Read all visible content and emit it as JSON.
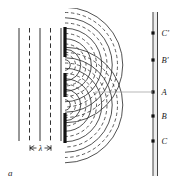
{
  "figure": {
    "panel_label": "a",
    "caption_text": ""
  },
  "plane_waves": {
    "description": "incoming plane wavefronts",
    "lines": [
      {
        "x": 19,
        "style": "solid"
      },
      {
        "x": 29.5,
        "style": "dashed"
      },
      {
        "x": 40,
        "style": "solid"
      },
      {
        "x": 50.5,
        "style": "dashed"
      },
      {
        "x": 61,
        "style": "solid"
      }
    ],
    "y_top": 28,
    "y_bottom": 141
  },
  "wavelength_marker": {
    "label": "λ",
    "x_left": 30,
    "x_right": 51,
    "y": 148
  },
  "barrier": {
    "x": 65,
    "segments": [
      {
        "y_top": 27,
        "y_bottom": 57
      },
      {
        "y_top": 73,
        "y_bottom": 97
      },
      {
        "y_top": 113,
        "y_bottom": 143
      }
    ],
    "slits": [
      {
        "x": 65,
        "y": 65
      },
      {
        "x": 65,
        "y": 105
      }
    ]
  },
  "waves": {
    "crest_style": "solid",
    "trough_style": "dashed",
    "spacing": 10.5,
    "count": 11
  },
  "screen": {
    "x_outer": 153,
    "x_inner": 157.5,
    "y_top": 12,
    "y_bottom": 176,
    "points": [
      {
        "label": "C′",
        "y": 33
      },
      {
        "label": "B′",
        "y": 60
      },
      {
        "label": "A",
        "y": 92
      },
      {
        "label": "B",
        "y": 116
      },
      {
        "label": "C",
        "y": 141
      }
    ]
  },
  "colors": {
    "ink": "#1a1a1a",
    "wave": "#333333",
    "background": "#ffffff"
  }
}
